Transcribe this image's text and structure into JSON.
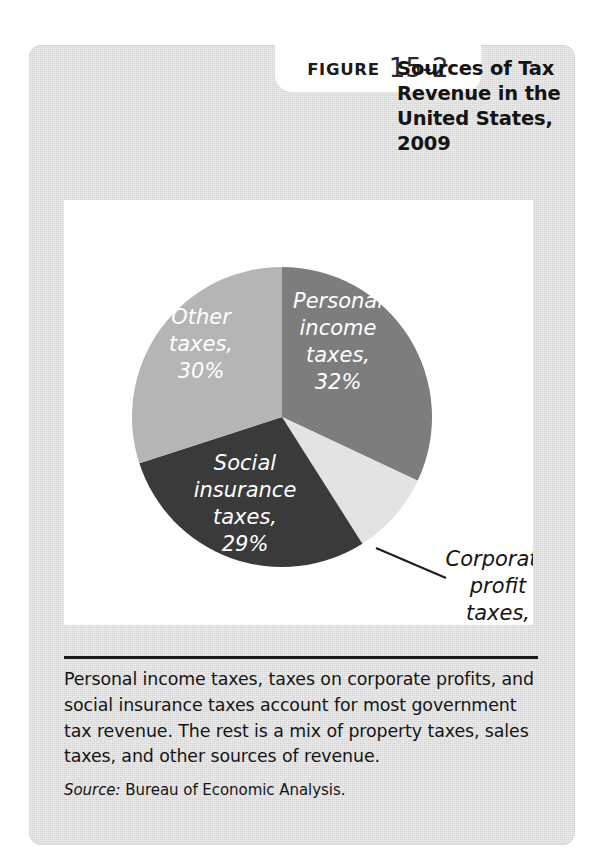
{
  "figure": {
    "badge_word": "FIGURE",
    "badge_number": "15-2",
    "title": "Sources of Tax Revenue in the United States, 2009",
    "caption": "Personal income taxes, taxes on corporate profits, and social insurance taxes account for most government tax revenue. The rest is a mix of property taxes, sales taxes, and other sources of revenue.",
    "source_label": "Source:",
    "source_text": "Bureau of Economic Analysis."
  },
  "colors": {
    "card_background": "#dcdcdc",
    "plate_background": "#ffffff",
    "rule": "#1d1d1d",
    "text": "#151515",
    "slice_personal": "#7d7d7d",
    "slice_corporate": "#e3e3e3",
    "slice_social": "#3a3a3a",
    "slice_other": "#b5b5b5",
    "leader_line": "#1d1d1d"
  },
  "chart_data": {
    "type": "pie",
    "title": "Sources of Tax Revenue in the United States, 2009",
    "xlabel": "",
    "ylabel": "",
    "legend_position": "none",
    "grid": false,
    "units": "percent",
    "start_angle_deg": 0,
    "direction": "clockwise",
    "categories": [
      "Personal income taxes",
      "Corporate profit taxes",
      "Social insurance taxes",
      "Other taxes"
    ],
    "values": [
      32,
      9,
      29,
      30
    ],
    "slices": [
      {
        "label": "Personal income taxes",
        "value": 32,
        "value_label": "32%",
        "color": "#7d7d7d",
        "label_lines": [
          "Personal",
          "income",
          "taxes,",
          "32%"
        ],
        "label_placement": "inside",
        "label_color": "#ffffff"
      },
      {
        "label": "Corporate profit taxes",
        "value": 9,
        "value_label": "9%",
        "color": "#e3e3e3",
        "label_lines": [
          "Corporate",
          "profit",
          "taxes,",
          "9%"
        ],
        "label_placement": "outside-callout",
        "label_color": "#151515"
      },
      {
        "label": "Social insurance taxes",
        "value": 29,
        "value_label": "29%",
        "color": "#3a3a3a",
        "label_lines": [
          "Social",
          "insurance",
          "taxes,",
          "29%"
        ],
        "label_placement": "inside",
        "label_color": "#ffffff"
      },
      {
        "label": "Other taxes",
        "value": 30,
        "value_label": "30%",
        "color": "#b5b5b5",
        "label_lines": [
          "Other",
          "taxes,",
          "30%"
        ],
        "label_placement": "inside",
        "label_color": "#ffffff"
      }
    ]
  }
}
